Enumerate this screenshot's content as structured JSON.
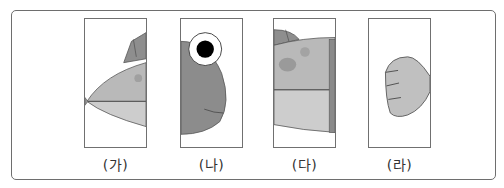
{
  "figure": {
    "panels": [
      {
        "id": "ga",
        "label": "(가)",
        "content": "fish head/mouth piece with dorsal fin"
      },
      {
        "id": "na",
        "label": "(나)",
        "content": "fish eye and cheek piece"
      },
      {
        "id": "da",
        "label": "(다)",
        "content": "fish body piece with spots"
      },
      {
        "id": "ra",
        "label": "(라)",
        "content": "fish tail fin piece"
      }
    ],
    "colors": {
      "body_light": "#c4c4c4",
      "body_mid": "#a8a8a8",
      "fin_dark": "#8a8a8a",
      "face_dark": "#8c8c8c",
      "spot": "#999999",
      "outline": "#555555",
      "eye_pupil": "#000000",
      "eye_white": "#ffffff"
    }
  }
}
